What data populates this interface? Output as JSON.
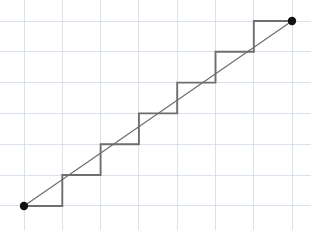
{
  "figure": {
    "canvas": {
      "width": 311,
      "height": 230
    },
    "background_color": "#ffffff"
  },
  "grid": {
    "label": "graph-paper-grid",
    "color": "#c9d4e4",
    "line_width": 0.7,
    "x_spacing": 38.3,
    "y_spacing": 30.8,
    "x_positions": [
      24,
      62.3,
      100.6,
      138.9,
      177.2,
      215.5,
      253.8,
      292.1
    ],
    "y_positions": [
      21,
      51.8,
      82.6,
      113.4,
      144.2,
      175,
      205.8
    ],
    "visible": true
  },
  "diagonal": {
    "label": "reference-diagonal",
    "color": "#6b6b6b",
    "line_width": 1.15,
    "start": {
      "x": 24,
      "y": 206
    },
    "end": {
      "x": 292,
      "y": 21
    }
  },
  "staircase": {
    "label": "step-function-polyline",
    "color": "#6e6e6e",
    "line_width": 1.9,
    "step_count": 7,
    "points": [
      {
        "x": 24,
        "y": 206
      },
      {
        "x": 62.3,
        "y": 206
      },
      {
        "x": 62.3,
        "y": 175
      },
      {
        "x": 100.6,
        "y": 175
      },
      {
        "x": 100.6,
        "y": 144.2
      },
      {
        "x": 138.9,
        "y": 144.2
      },
      {
        "x": 138.9,
        "y": 113.4
      },
      {
        "x": 177.2,
        "y": 113.4
      },
      {
        "x": 177.2,
        "y": 82.6
      },
      {
        "x": 215.5,
        "y": 82.6
      },
      {
        "x": 215.5,
        "y": 51.8
      },
      {
        "x": 253.8,
        "y": 51.8
      },
      {
        "x": 253.8,
        "y": 21
      },
      {
        "x": 292,
        "y": 21
      }
    ],
    "path_d": "M 24 206 L 62.3 206 L 62.3 175 L 100.6 175 L 100.6 144.2 L 138.9 144.2 L 138.9 113.4 L 177.2 113.4 L 177.2 82.6 L 215.5 82.6 L 215.5 51.8 L 253.8 51.8 L 253.8 21 L 292 21"
  },
  "endpoints": [
    {
      "name": "lower-left-endpoint",
      "x": 24,
      "y": 206,
      "radius": 4.2,
      "color": "#111111"
    },
    {
      "name": "upper-right-endpoint",
      "x": 292,
      "y": 21,
      "radius": 4.2,
      "color": "#111111"
    }
  ],
  "chart_data": {
    "type": "line",
    "xlabel": "",
    "ylabel": "",
    "grid": true,
    "legend": "none",
    "xlim": [
      0,
      7
    ],
    "ylim": [
      0,
      6
    ],
    "series": [
      {
        "name": "diagonal",
        "type": "line",
        "x": [
          0,
          7
        ],
        "y": [
          0,
          6
        ]
      },
      {
        "name": "staircase",
        "type": "step",
        "x": [
          0,
          1,
          1,
          2,
          2,
          3,
          3,
          4,
          4,
          5,
          5,
          6,
          6,
          7
        ],
        "y": [
          0,
          0,
          1,
          1,
          2,
          2,
          3,
          3,
          4,
          4,
          5,
          5,
          6,
          6
        ]
      }
    ],
    "markers": [
      {
        "x": 0,
        "y": 0
      },
      {
        "x": 7,
        "y": 6
      }
    ]
  }
}
